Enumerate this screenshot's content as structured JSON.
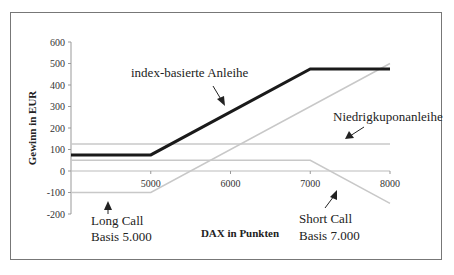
{
  "chart_data": {
    "type": "line",
    "title": "",
    "xlabel": "DAX in Punkten",
    "ylabel": "Gewinn in EUR",
    "xlim": [
      4000,
      8000
    ],
    "ylim": [
      -200,
      600
    ],
    "x_ticks": [
      "5000",
      "6000",
      "7000",
      "8000"
    ],
    "y_ticks": [
      "600",
      "500",
      "400",
      "300",
      "200",
      "100",
      "0",
      "-100",
      "-200"
    ],
    "grid": false,
    "legend": "none (inline annotations)",
    "series": [
      {
        "name": "index-basierte Anleihe",
        "color": "#1a1a1a",
        "width": 3,
        "x": [
          4000,
          5000,
          7000,
          8000
        ],
        "y": [
          75,
          75,
          475,
          475
        ]
      },
      {
        "name": "Niedrigkuponanleihe",
        "color": "#c8c8c8",
        "width": 1.5,
        "x": [
          4000,
          8000
        ],
        "y": [
          125,
          125
        ]
      },
      {
        "name": "Long Call Basis 5.000",
        "color": "#c8c8c8",
        "width": 1.5,
        "x": [
          4000,
          5000,
          8000
        ],
        "y": [
          -100,
          -100,
          500
        ]
      },
      {
        "name": "Short Call Basis 7.000",
        "color": "#c8c8c8",
        "width": 1.5,
        "x": [
          4000,
          7000,
          8000
        ],
        "y": [
          50,
          50,
          -150
        ]
      }
    ],
    "annotations": [
      {
        "text": "index-basierte Anleihe"
      },
      {
        "text": "Niedrigkuponanleihe"
      },
      {
        "text_line1": "Long Call",
        "text_line2": "Basis 5.000"
      },
      {
        "text_line1": "Short Call",
        "text_line2": "Basis 7.000"
      }
    ]
  }
}
